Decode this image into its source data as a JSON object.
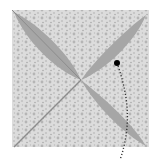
{
  "diagram": {
    "colors": {
      "background": "#ffffff",
      "paper": "#d9d9d9",
      "pattern": "#bdbdbd",
      "petal": "#a6a6a6",
      "crease": "#8c8c8c",
      "marker": "#000000"
    },
    "square": {
      "x": 12,
      "y": 10,
      "size": 137
    },
    "center": {
      "x": 81,
      "y": 80
    },
    "petals": [
      {
        "name": "petal-top-left",
        "path": "M14,12 C40,25 70,55 81,80 C55,70 25,40 14,12 Z"
      },
      {
        "name": "petal-top-right",
        "path": "M146,15 C125,30 95,60 81,80 C105,70 135,42 146,15 Z"
      },
      {
        "name": "petal-bottom-right",
        "path": "M146,146 C130,120 100,95 81,80 C95,105 125,135 146,146 Z"
      }
    ],
    "creases": [
      {
        "name": "crease-diagonal-bl",
        "x1": 81,
        "y1": 80,
        "x2": 14,
        "y2": 147
      },
      {
        "name": "crease-diagonal-tl",
        "x1": 12,
        "y1": 10,
        "x2": 81,
        "y2": 80
      }
    ],
    "marker": {
      "cx": 117,
      "cy": 63,
      "r": 3
    },
    "dotted_line": {
      "path": "M118,66 C128,95 132,125 120,160"
    }
  }
}
